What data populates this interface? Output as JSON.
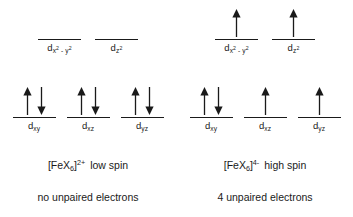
{
  "diagram": {
    "panels": [
      {
        "id": "low-spin",
        "side": "left",
        "eg": {
          "orbitals": [
            {
              "name": "dx2-y2",
              "label_base": "d",
              "label_sub": "x",
              "label_sub_sup1": "2",
              "label_sub_mid": " - y",
              "label_sub_sup2": "2",
              "electrons": []
            },
            {
              "name": "dz2",
              "label_base": "d",
              "label_sub": "z",
              "label_sub_sup1": "2",
              "label_sub_mid": "",
              "label_sub_sup2": "",
              "electrons": []
            }
          ]
        },
        "t2g": {
          "orbitals": [
            {
              "name": "dxy",
              "label_base": "d",
              "label_sub": "xy",
              "label_sub_sup1": "",
              "label_sub_mid": "",
              "label_sub_sup2": "",
              "electrons": [
                "up",
                "down"
              ]
            },
            {
              "name": "dxz",
              "label_base": "d",
              "label_sub": "xz",
              "label_sub_sup1": "",
              "label_sub_mid": "",
              "label_sub_sup2": "",
              "electrons": [
                "up",
                "down"
              ]
            },
            {
              "name": "dyz",
              "label_base": "d",
              "label_sub": "yz",
              "label_sub_sup1": "",
              "label_sub_mid": "",
              "label_sub_sup2": "",
              "electrons": [
                "up",
                "down"
              ]
            }
          ]
        },
        "formula_prefix": "[FeX",
        "formula_sub": "6",
        "formula_bracket": "]",
        "formula_charge": "2+",
        "spin_text": "low spin",
        "note": "no unpaired electrons",
        "unpaired_count": 0
      },
      {
        "id": "high-spin",
        "side": "right",
        "eg": {
          "orbitals": [
            {
              "name": "dx2-y2",
              "label_base": "d",
              "label_sub": "x",
              "label_sub_sup1": "2",
              "label_sub_mid": " - y",
              "label_sub_sup2": "2",
              "electrons": [
                "up"
              ]
            },
            {
              "name": "dz2",
              "label_base": "d",
              "label_sub": "z",
              "label_sub_sup1": "2",
              "label_sub_mid": "",
              "label_sub_sup2": "",
              "electrons": [
                "up"
              ]
            }
          ]
        },
        "t2g": {
          "orbitals": [
            {
              "name": "dxy",
              "label_base": "d",
              "label_sub": "xy",
              "label_sub_sup1": "",
              "label_sub_mid": "",
              "label_sub_sup2": "",
              "electrons": [
                "up",
                "down"
              ]
            },
            {
              "name": "dxz",
              "label_base": "d",
              "label_sub": "xz",
              "label_sub_sup1": "",
              "label_sub_mid": "",
              "label_sub_sup2": "",
              "electrons": [
                "up"
              ]
            },
            {
              "name": "dyz",
              "label_base": "d",
              "label_sub": "yz",
              "label_sub_sup1": "",
              "label_sub_mid": "",
              "label_sub_sup2": "",
              "electrons": [
                "up"
              ]
            }
          ]
        },
        "formula_prefix": "[FeX",
        "formula_sub": "6",
        "formula_bracket": "]",
        "formula_charge": "4-",
        "spin_text": "high spin",
        "note": "4 unpaired electrons",
        "unpaired_count": 4
      }
    ],
    "colors": {
      "background": "#ffffff",
      "ink": "#1a1a1a"
    }
  }
}
